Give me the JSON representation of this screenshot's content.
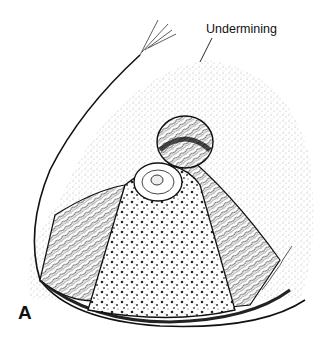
{
  "figure": {
    "labels": {
      "undermining": "Undermining"
    },
    "panel_letter": "A",
    "colors": {
      "ink": "#111111",
      "background": "#ffffff",
      "stipple": "#6a6a6a"
    }
  }
}
